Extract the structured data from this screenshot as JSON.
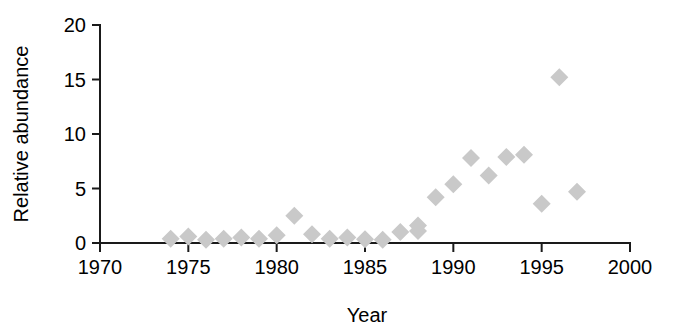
{
  "chart_data": {
    "type": "scatter",
    "title": "",
    "xlabel": "Year",
    "ylabel": "Relative abundance",
    "xlim": [
      1970,
      2000
    ],
    "ylim": [
      0,
      20
    ],
    "xticks": [
      1970,
      1975,
      1980,
      1985,
      1990,
      1995,
      2000
    ],
    "xticklabels": [
      "1970",
      "1975",
      "1980",
      "1985",
      "1990",
      "1995",
      "2000"
    ],
    "yticks": [
      0,
      5,
      10,
      15,
      20
    ],
    "yticklabels": [
      "0",
      "5",
      "10",
      "15",
      "20"
    ],
    "grid": false,
    "legend": null,
    "marker": "diamond",
    "marker_color": "#c9c9c9",
    "axis_color": "#1a1a1a",
    "series": [
      {
        "name": "Relative abundance",
        "x": [
          1974,
          1975,
          1976,
          1977,
          1978,
          1979,
          1980,
          1981,
          1982,
          1983,
          1984,
          1985,
          1986,
          1987,
          1988,
          1988,
          1989,
          1990,
          1991,
          1992,
          1993,
          1994,
          1995,
          1996,
          1997
        ],
        "y": [
          0.4,
          0.6,
          0.3,
          0.4,
          0.5,
          0.4,
          0.7,
          2.5,
          0.8,
          0.4,
          0.5,
          0.35,
          0.3,
          1.0,
          1.6,
          1.1,
          4.2,
          5.4,
          7.8,
          6.2,
          7.9,
          8.1,
          3.6,
          15.2,
          4.7
        ]
      }
    ]
  }
}
